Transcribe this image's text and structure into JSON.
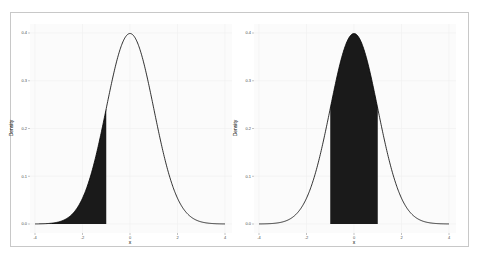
{
  "chart_data": [
    {
      "type": "area",
      "title": "",
      "xlabel": "x",
      "ylabel": "Density",
      "xlim": [
        -4,
        4
      ],
      "ylim": [
        0,
        0.4
      ],
      "x_ticks": [
        "-4",
        "-2",
        "0",
        "2",
        "4"
      ],
      "y_ticks": [
        "0.0",
        "0.1",
        "0.2",
        "0.3",
        "0.4"
      ],
      "grid": true,
      "curve": "standard normal density",
      "shaded_region": {
        "from": -4,
        "to": -1,
        "fill": "#1a1a1a"
      },
      "legend": null
    },
    {
      "type": "area",
      "title": "",
      "xlabel": "x",
      "ylabel": "Density",
      "xlim": [
        -4,
        4
      ],
      "ylim": [
        0,
        0.4
      ],
      "x_ticks": [
        "-4",
        "-2",
        "0",
        "2",
        "4"
      ],
      "y_ticks": [
        "0.0",
        "0.1",
        "0.2",
        "0.3",
        "0.4"
      ],
      "grid": true,
      "curve": "standard normal density",
      "shaded_region": {
        "from": -1,
        "to": 1,
        "fill": "#1a1a1a"
      },
      "legend": null
    }
  ],
  "panels": [
    {
      "xlabel": "x",
      "ylabel": "Density"
    },
    {
      "xlabel": "x",
      "ylabel": "Density"
    }
  ]
}
